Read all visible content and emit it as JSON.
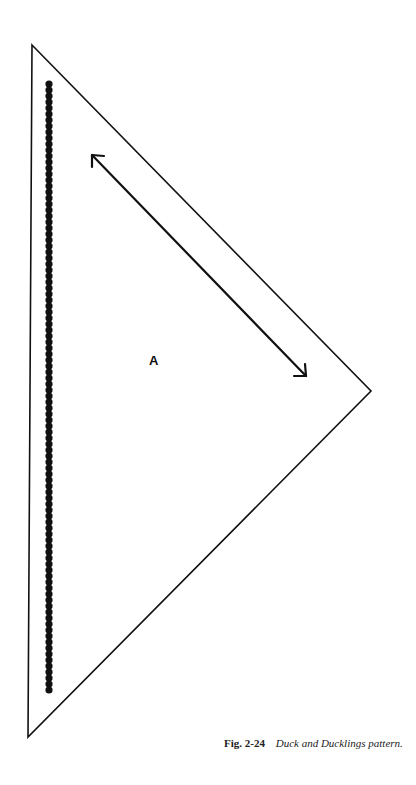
{
  "figure": {
    "pattern_piece_label": "A",
    "caption": {
      "number": "Fig. 2-24",
      "title": "Duck and Ducklings pattern."
    },
    "shape": "triangle",
    "vertices": {
      "top": [
        32,
        45
      ],
      "right": [
        371,
        391
      ],
      "bottom": [
        28,
        737
      ]
    },
    "grain_arrow": {
      "start": [
        92,
        155
      ],
      "end": [
        306,
        376
      ],
      "double_headed": true
    },
    "bead_line": {
      "x": 49,
      "y_start": 84,
      "y_end": 690,
      "spacing": 6,
      "bead_radius": 3.6
    },
    "colors": {
      "line": "#111111",
      "background": "#ffffff"
    }
  }
}
